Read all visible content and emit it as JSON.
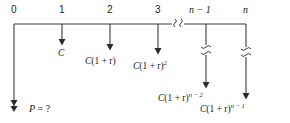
{
  "diagram": {
    "type": "cash-flow-timeline",
    "colors": {
      "line": "#3a3a3a",
      "text": "#1a1a1a",
      "background": "#ffffff"
    },
    "axis": {
      "y": 24,
      "x_start": 14,
      "x_end": 246,
      "break_x": 178,
      "break_symbol": "≀"
    },
    "ticks": [
      {
        "label": "0",
        "x": 14,
        "italic": false
      },
      {
        "label": "1",
        "x": 62,
        "italic": false
      },
      {
        "label": "2",
        "x": 110,
        "italic": false
      },
      {
        "label": "3",
        "x": 158,
        "italic": false
      },
      {
        "label": "n − 1",
        "x": 206,
        "italic": true
      },
      {
        "label": "n",
        "x": 246,
        "italic": true
      }
    ],
    "cash_flows": [
      {
        "tick": "1",
        "x": 62,
        "arrow_top": 24,
        "arrow_bottom": 45,
        "has_break": false,
        "label": "C",
        "base": "C",
        "factor": "",
        "exponent": "",
        "label_x": 58,
        "label_y": 49
      },
      {
        "tick": "2",
        "x": 110,
        "arrow_top": 24,
        "arrow_bottom": 50,
        "has_break": false,
        "label": "C(1 + r)",
        "base": "C",
        "factor": "(1 + r)",
        "exponent": "",
        "label_x": 85,
        "label_y": 57
      },
      {
        "tick": "3",
        "x": 158,
        "arrow_top": 24,
        "arrow_bottom": 54,
        "has_break": false,
        "label": "C(1 + r)2",
        "base": "C",
        "factor": "(1 + r)",
        "exponent": "2",
        "label_x": 133,
        "label_y": 62
      },
      {
        "tick": "n − 1",
        "x": 206,
        "arrow_top": 24,
        "arrow_bottom": 88,
        "has_break": true,
        "break_y": 50,
        "label": "C(1 + r)n − 2",
        "base": "C",
        "factor": "(1 + r)",
        "exponent": "n − 2",
        "label_x": 158,
        "label_y": 94
      },
      {
        "tick": "n",
        "x": 246,
        "arrow_top": 24,
        "arrow_bottom": 99,
        "has_break": true,
        "break_y": 52,
        "label": "C(1 + r)n − 1",
        "base": "C",
        "factor": "(1 + r)",
        "exponent": "n − 1",
        "label_x": 200,
        "label_y": 105
      }
    ],
    "present_value": {
      "x": 14,
      "arrow_top": 24,
      "arrow_bottom": 112,
      "double_head": true,
      "label": "P = ?",
      "symbol": "P",
      "rest": " = ?",
      "label_x": 29,
      "label_y": 104
    }
  }
}
